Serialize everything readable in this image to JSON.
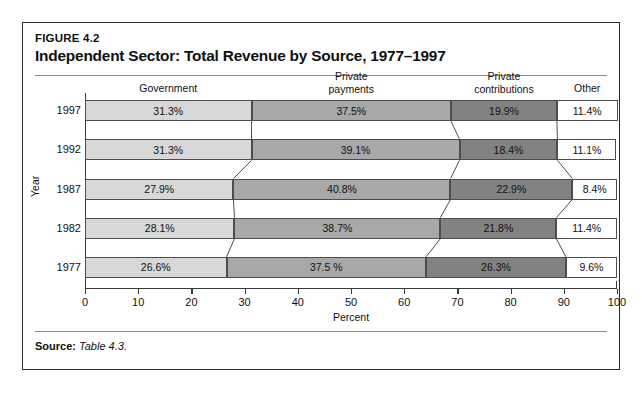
{
  "figure": {
    "number": "FIGURE 4.2",
    "title": "Independent Sector: Total Revenue by Source, 1977–1997",
    "source_label": "Source:",
    "source_value": "Table 4.3."
  },
  "chart_data": {
    "type": "bar",
    "orientation": "horizontal-stacked",
    "title": "Independent Sector: Total Revenue by Source, 1977–1997",
    "xlabel": "Percent",
    "ylabel": "Year",
    "xlim": [
      0,
      100
    ],
    "xticks": [
      "0",
      "10",
      "20",
      "30",
      "40",
      "50",
      "60",
      "70",
      "80",
      "90",
      "100"
    ],
    "grid": false,
    "legend_position": "top-column-headers",
    "categories": [
      "1997",
      "1992",
      "1987",
      "1982",
      "1977"
    ],
    "series": [
      {
        "name": "Government",
        "header": "Government",
        "color": "#d8d8d8",
        "values": [
          31.3,
          31.3,
          27.9,
          28.1,
          26.6
        ],
        "labels": [
          "31.3%",
          "31.3%",
          "27.9%",
          "28.1%",
          "26.6%"
        ]
      },
      {
        "name": "Private payments",
        "header": "Private\npayments",
        "color": "#a8a8a8",
        "values": [
          37.5,
          39.1,
          40.8,
          38.7,
          37.5
        ],
        "labels": [
          "37.5%",
          "39.1%",
          "40.8%",
          "38.7%",
          "37.5 %"
        ]
      },
      {
        "name": "Private contributions",
        "header": "Private\ncontributions",
        "color": "#828282",
        "values": [
          19.9,
          18.4,
          22.9,
          21.8,
          26.3
        ],
        "labels": [
          "19.9%",
          "18.4%",
          "22.9%",
          "21.8%",
          "26.3%"
        ]
      },
      {
        "name": "Other",
        "header": "Other",
        "color": "#ffffff",
        "values": [
          11.4,
          11.1,
          8.4,
          11.4,
          9.6
        ],
        "labels": [
          "11.4%",
          "11.1%",
          "8.4%",
          "11.4%",
          "9.6%"
        ]
      }
    ]
  }
}
